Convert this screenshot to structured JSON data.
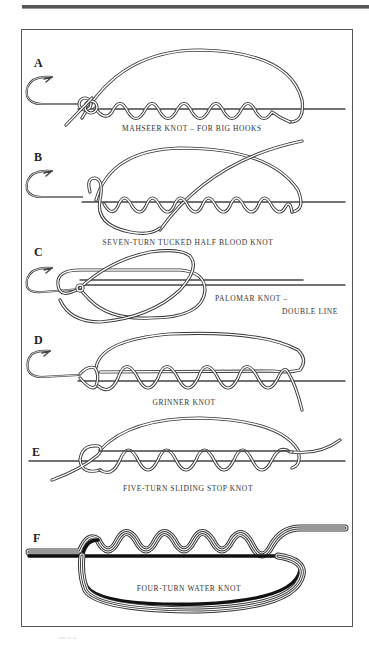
{
  "figure": {
    "panels": [
      {
        "letter": "A",
        "caption": "MAHSEER KNOT – FOR BIG HOOKS"
      },
      {
        "letter": "B",
        "caption": "SEVEN-TURN TUCKED HALF BLOOD KNOT"
      },
      {
        "letter": "C",
        "caption_line1": "PALOMAR KNOT –",
        "caption_line2": "DOUBLE LINE"
      },
      {
        "letter": "D",
        "caption": "GRINNER KNOT"
      },
      {
        "letter": "E",
        "caption": "FIVE-TURN SLIDING STOP KNOT"
      },
      {
        "letter": "F",
        "caption": "FOUR-TURN WATER KNOT"
      }
    ],
    "footer_mark": "~~ ~ ~"
  },
  "colors": {
    "line": "#333333",
    "frame": "#555555",
    "background": "#ffffff"
  }
}
